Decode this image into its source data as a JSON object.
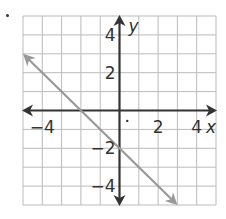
{
  "chart_data": {
    "type": "line",
    "title": "",
    "xlabel": "x",
    "ylabel": "y",
    "xlim": [
      -5,
      5
    ],
    "ylim": [
      -5,
      5
    ],
    "grid": true,
    "x_ticks": [
      -4,
      2,
      4
    ],
    "y_ticks": [
      4,
      2,
      -2,
      -4
    ],
    "x_tick_labels": [
      "−4",
      "2",
      "4"
    ],
    "y_tick_labels": [
      "4",
      "2",
      "−2",
      "−4"
    ],
    "series": [
      {
        "name": "line",
        "equation": "y = -x - 2",
        "points": [
          [
            -5,
            3
          ],
          [
            -2,
            0
          ],
          [
            0,
            -2
          ],
          [
            3,
            -5
          ]
        ],
        "arrows_both_ends": true,
        "color": "#999999"
      }
    ],
    "axis_color": "#333333",
    "grid_color": "#bbbbbb"
  }
}
